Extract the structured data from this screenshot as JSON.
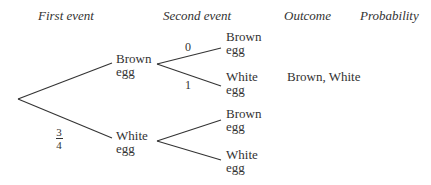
{
  "headers": {
    "first_event": "First event",
    "second_event": "Second event",
    "outcome": "Outcome",
    "probability": "Probability"
  },
  "first_level": {
    "brown": {
      "line1": "Brown",
      "line2": "egg"
    },
    "white": {
      "line1": "White",
      "line2": "egg"
    },
    "white_prob": {
      "numerator": "3",
      "denominator": "4"
    }
  },
  "second_level": {
    "from_brown": {
      "brown": {
        "line1": "Brown",
        "line2": "egg",
        "prob": "0"
      },
      "white": {
        "line1": "White",
        "line2": "egg",
        "prob": "1"
      }
    },
    "from_white": {
      "brown": {
        "line1": "Brown",
        "line2": "egg"
      },
      "white": {
        "line1": "White",
        "line2": "egg"
      }
    }
  },
  "outcomes": {
    "brown_white": "Brown, White"
  },
  "colors": {
    "line": "#333333",
    "text": "#333333",
    "background": "#ffffff"
  }
}
